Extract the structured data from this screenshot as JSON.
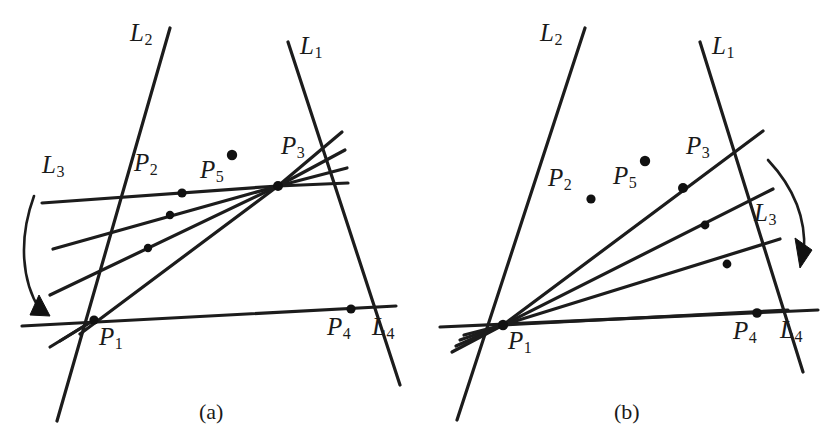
{
  "figure": {
    "background_color": "#ffffff",
    "ink_color": "#1c1c1c",
    "width": 839,
    "height": 442
  },
  "captions": [
    {
      "id": "caption-a",
      "text": "(a)",
      "x": 199,
      "y": 399
    },
    {
      "id": "caption-b",
      "text": "(b)",
      "x": 614,
      "y": 399
    }
  ],
  "panels": [
    {
      "id": "panel-a",
      "caption": "(a)",
      "labels": [
        {
          "id": "label-L2-a",
          "base": "L",
          "sub": "2",
          "x": 130,
          "y": 20
        },
        {
          "id": "label-L1-a",
          "base": "L",
          "sub": "1",
          "x": 300,
          "y": 33
        },
        {
          "id": "label-L3-a",
          "base": "L",
          "sub": "3",
          "x": 42,
          "y": 152
        },
        {
          "id": "label-P2-a",
          "base": "P",
          "sub": "2",
          "x": 134,
          "y": 150
        },
        {
          "id": "label-P5-a",
          "base": "P",
          "sub": "5",
          "x": 200,
          "y": 157
        },
        {
          "id": "label-P3-a",
          "base": "P",
          "sub": "3",
          "x": 281,
          "y": 133
        },
        {
          "id": "label-P1-a",
          "base": "P",
          "sub": "1",
          "x": 99,
          "y": 324
        },
        {
          "id": "label-P4-a",
          "base": "P",
          "sub": "4",
          "x": 327,
          "y": 314
        },
        {
          "id": "label-L4-a",
          "base": "L",
          "sub": "4",
          "x": 372,
          "y": 314
        }
      ],
      "lines": [
        {
          "id": "line-L2-a",
          "name": "L2",
          "x1": 170,
          "y1": 28,
          "x2": 57,
          "y2": 421
        },
        {
          "id": "line-L1-a",
          "name": "L1",
          "x1": 288,
          "y1": 42,
          "x2": 400,
          "y2": 385
        },
        {
          "id": "line-L4-a",
          "name": "L4",
          "x1": 22,
          "y1": 326,
          "x2": 396,
          "y2": 306
        },
        {
          "id": "line-L3-a-1",
          "name": "L3-rotation-1",
          "x1": 42,
          "y1": 203,
          "x2": 278,
          "y2": 186
        },
        {
          "id": "line-L3-a-2",
          "name": "L3-rotation-2",
          "x1": 53,
          "y1": 249,
          "x2": 278,
          "y2": 186
        },
        {
          "id": "line-L3-a-3",
          "name": "L3-rotation-3",
          "x1": 50,
          "y1": 295,
          "x2": 278,
          "y2": 186
        },
        {
          "id": "line-L3-a-4",
          "name": "L3-rotation-4",
          "x1": 80,
          "y1": 334,
          "x2": 278,
          "y2": 186
        },
        {
          "id": "line-fan-a-1",
          "name": "P3-fan-1",
          "x1": 278,
          "y1": 186,
          "x2": 342,
          "y2": 132
        },
        {
          "id": "line-fan-a-2",
          "name": "P3-fan-2",
          "x1": 278,
          "y1": 186,
          "x2": 345,
          "y2": 150
        },
        {
          "id": "line-fan-a-3",
          "name": "P3-fan-3",
          "x1": 278,
          "y1": 186,
          "x2": 347,
          "y2": 168
        },
        {
          "id": "line-fan-a-4",
          "name": "P3-fan-4",
          "x1": 278,
          "y1": 186,
          "x2": 348,
          "y2": 183
        },
        {
          "id": "line-stub-a-1",
          "name": "P1-stub-1",
          "x1": 94,
          "y1": 320,
          "x2": 50,
          "y2": 347
        },
        {
          "id": "line-stub-a-2",
          "name": "P1-stub-2",
          "x1": 94,
          "y1": 320,
          "x2": 60,
          "y2": 341
        }
      ],
      "points": [
        {
          "id": "pt-P1-a",
          "name": "P1",
          "x": 94,
          "y": 320,
          "r": 4.6
        },
        {
          "id": "pt-P2-a",
          "name": "P2",
          "x": 182,
          "y": 193,
          "r": 4.6
        },
        {
          "id": "pt-P3-a",
          "name": "P3",
          "x": 278,
          "y": 186,
          "r": 5.0
        },
        {
          "id": "pt-P4-a",
          "name": "P4",
          "x": 351,
          "y": 309,
          "r": 4.6
        },
        {
          "id": "pt-P5-a",
          "name": "P5",
          "x": 232,
          "y": 155,
          "r": 5.2
        },
        {
          "id": "pt-x-a-1",
          "name": "intersection-1",
          "x": 170,
          "y": 215,
          "r": 4.2
        },
        {
          "id": "pt-x-a-2",
          "name": "intersection-2",
          "x": 148,
          "y": 248,
          "r": 4.2
        }
      ],
      "arc": {
        "id": "arc-a",
        "name": "rotation-arrow-a",
        "path": "M 34 196 C 18 240, 22 282, 40 310",
        "head": "39,295 50,316 30,315"
      }
    },
    {
      "id": "panel-b",
      "caption": "(b)",
      "labels": [
        {
          "id": "label-L2-b",
          "base": "L",
          "sub": "2",
          "x": 540,
          "y": 20
        },
        {
          "id": "label-L1-b",
          "base": "L",
          "sub": "1",
          "x": 712,
          "y": 33
        },
        {
          "id": "label-L3-b",
          "base": "L",
          "sub": "3",
          "x": 754,
          "y": 200
        },
        {
          "id": "label-P2-b",
          "base": "P",
          "sub": "2",
          "x": 548,
          "y": 165
        },
        {
          "id": "label-P5-b",
          "base": "P",
          "sub": "5",
          "x": 613,
          "y": 163
        },
        {
          "id": "label-P3-b",
          "base": "P",
          "sub": "3",
          "x": 686,
          "y": 133
        },
        {
          "id": "label-P1-b",
          "base": "P",
          "sub": "1",
          "x": 508,
          "y": 328
        },
        {
          "id": "label-P4-b",
          "base": "P",
          "sub": "4",
          "x": 733,
          "y": 318
        },
        {
          "id": "label-L4-b",
          "base": "L",
          "sub": "4",
          "x": 780,
          "y": 317
        }
      ],
      "lines": [
        {
          "id": "line-L2-b",
          "name": "L2",
          "x1": 585,
          "y1": 28,
          "x2": 457,
          "y2": 420
        },
        {
          "id": "line-L1-b",
          "name": "L1",
          "x1": 700,
          "y1": 42,
          "x2": 803,
          "y2": 372
        },
        {
          "id": "line-L4-b",
          "name": "L4",
          "x1": 440,
          "y1": 327,
          "x2": 818,
          "y2": 310
        },
        {
          "id": "line-L3-b-1",
          "name": "L3-rotation-1",
          "x1": 503,
          "y1": 325,
          "x2": 763,
          "y2": 131
        },
        {
          "id": "line-L3-b-2",
          "name": "L3-rotation-2",
          "x1": 503,
          "y1": 325,
          "x2": 773,
          "y2": 189
        },
        {
          "id": "line-L3-b-3",
          "name": "L3-rotation-3",
          "x1": 503,
          "y1": 325,
          "x2": 780,
          "y2": 239
        },
        {
          "id": "line-L3-b-4",
          "name": "L3-rotation-4",
          "x1": 503,
          "y1": 325,
          "x2": 788,
          "y2": 310
        },
        {
          "id": "line-stub-b-1",
          "name": "P1-stub-1",
          "x1": 503,
          "y1": 325,
          "x2": 452,
          "y2": 352
        },
        {
          "id": "line-stub-b-2",
          "name": "P1-stub-2",
          "x1": 503,
          "y1": 325,
          "x2": 456,
          "y2": 346
        },
        {
          "id": "line-stub-b-3",
          "name": "P1-stub-3",
          "x1": 503,
          "y1": 325,
          "x2": 460,
          "y2": 340
        },
        {
          "id": "line-stub-b-4",
          "name": "P1-stub-4",
          "x1": 503,
          "y1": 325,
          "x2": 464,
          "y2": 335
        }
      ],
      "points": [
        {
          "id": "pt-P1-b",
          "name": "P1",
          "x": 503,
          "y": 325,
          "r": 5.2
        },
        {
          "id": "pt-P2-b",
          "name": "P2",
          "x": 591,
          "y": 199,
          "r": 4.6
        },
        {
          "id": "pt-P3-b",
          "name": "P3",
          "x": 683,
          "y": 188,
          "r": 5.0
        },
        {
          "id": "pt-P4-b",
          "name": "P4",
          "x": 757,
          "y": 313,
          "r": 4.8
        },
        {
          "id": "pt-P5-b",
          "name": "P5",
          "x": 645,
          "y": 161,
          "r": 5.2
        },
        {
          "id": "pt-x-b-1",
          "name": "intersection-1",
          "x": 705,
          "y": 225,
          "r": 4.4
        },
        {
          "id": "pt-x-b-2",
          "name": "intersection-2",
          "x": 727,
          "y": 264,
          "r": 4.4
        }
      ],
      "arc": {
        "id": "arc-b",
        "name": "rotation-arrow-b",
        "path": "M 768 160 C 796 190, 806 222, 804 252",
        "head": "795,238 812,250 800,268"
      }
    }
  ]
}
